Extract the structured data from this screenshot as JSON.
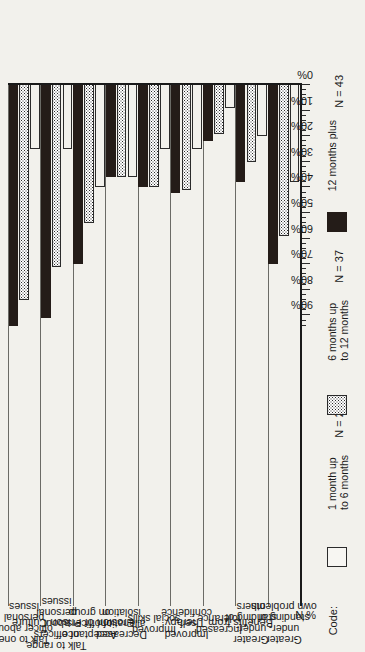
{
  "chart_data": {
    "type": "bar",
    "orientation": "horizontal",
    "title": "",
    "xlabel": "% N",
    "ylabel": "",
    "ylim": [
      0,
      95
    ],
    "grid": true,
    "legend_position": "right",
    "axis_label": "% N",
    "tick_labels": [
      "90%",
      "80%",
      "70%",
      "60%",
      "50%",
      "40%",
      "30%",
      "20%",
      "10%",
      "0%"
    ],
    "tick_values": [
      90,
      80,
      70,
      60,
      50,
      40,
      30,
      20,
      10,
      0
    ],
    "groups": [
      {
        "name": "Erosion of Prison Culture"
      },
      {
        "name": "Benefits from Therapy"
      }
    ],
    "categories": [
      "Talk to one officer about personal issues",
      "Talk to range of officers about personal issues",
      "Acceptance of officers on group",
      "Decreased alienation/ isolation",
      "Improved social skills",
      "Improved self- confidence",
      "Increased tolerance",
      "Greater under- standing of others",
      "Greater under- standing of own problems"
    ],
    "category_lines": [
      [
        "Talk to one",
        "officer about",
        "personal",
        "issues"
      ],
      [
        "Talk to range",
        "of officers",
        "about",
        "personal",
        "issues"
      ],
      [
        "Acceptance",
        "of officers",
        "on group"
      ],
      [
        "Decreased",
        "alienation/",
        "isolation"
      ],
      [
        "Improved",
        "social skills"
      ],
      [
        "Improved",
        "self-",
        "confidence"
      ],
      [
        "Increased",
        "tolerance"
      ],
      [
        "Greater",
        "under-",
        "standing of",
        "others"
      ],
      [
        "Greater",
        "under-",
        "standing of",
        "own problems"
      ]
    ],
    "series": [
      {
        "name": "1 month up to 6 months",
        "n_label": "N = 22",
        "color": "#f7f6f2",
        "values": [
          25,
          25,
          40,
          36,
          25,
          25,
          9,
          20,
          38
        ]
      },
      {
        "name": "6 months up to 12 months",
        "n_label": "N = 37",
        "color": "#b9b9b3",
        "values": [
          84,
          71,
          54,
          36,
          40,
          41,
          19,
          30,
          59
        ]
      },
      {
        "name": "12 months plus",
        "n_label": "N = 43",
        "color": "#241c18",
        "values": [
          94,
          91,
          70,
          36,
          40,
          42,
          22,
          38,
          70
        ]
      }
    ]
  },
  "legend": {
    "code_label": "Code:",
    "items": [
      {
        "label_line1": "1 month up",
        "label_line2": "to 6 months",
        "n": "N = 22",
        "swatch": "open-swatch"
      },
      {
        "label_line1": "6 months up",
        "label_line2": "to 12 months",
        "n": "N = 37",
        "swatch": "dotted-swatch"
      },
      {
        "label_line1": "12 months plus",
        "label_line2": "",
        "n": "N = 43",
        "swatch": "solid-swatch"
      }
    ]
  },
  "axis": {
    "percent_n": "% N"
  }
}
